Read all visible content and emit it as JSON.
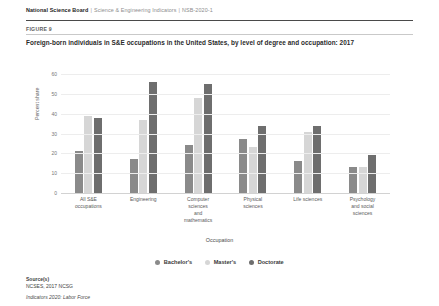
{
  "header": {
    "org": "National Science Board",
    "separator": "|",
    "publication": "Science & Engineering Indicators",
    "report_code": "NSB-2020-1"
  },
  "figure": {
    "label": "FIGURE 9",
    "title": "Foreign-born individuals in S&E occupations in the United States, by level of degree and occupation: 2017"
  },
  "source": {
    "label": "Source(s)",
    "line1": "NCSES, 2017 NCSG",
    "line2": "Indicators 2020: Labor Force"
  },
  "chart_data": {
    "type": "bar",
    "title": "Foreign-born individuals in S&E occupations in the United States, by level of degree and occupation: 2017",
    "xlabel": "Occupation",
    "ylabel": "Percent share",
    "ylim": [
      0,
      60
    ],
    "yticks": [
      "0",
      "10",
      "20",
      "30",
      "40",
      "50",
      "60"
    ],
    "grid": true,
    "legend_position": "bottom",
    "categories": [
      "All S&E occupations",
      "Engineering",
      "Computer sciences and mathematics",
      "Physical sciences",
      "Life sciences",
      "Psychology and social sciences"
    ],
    "category_lines": [
      [
        "All S&E",
        "occupations"
      ],
      [
        "Engineering"
      ],
      [
        "Computer",
        "sciences",
        "and",
        "mathematics"
      ],
      [
        "Physical",
        "sciences"
      ],
      [
        "Life sciences"
      ],
      [
        "Psychology",
        "and social",
        "sciences"
      ]
    ],
    "series": [
      {
        "name": "Bachelor's",
        "color": "#8a8a8a",
        "values": [
          21,
          17,
          24,
          27,
          16,
          13
        ]
      },
      {
        "name": "Master's",
        "color": "#d6d6d6",
        "values": [
          39,
          37,
          48,
          23,
          31,
          13
        ]
      },
      {
        "name": "Doctorate",
        "color": "#6e6e6e",
        "values": [
          38,
          56,
          55,
          34,
          34,
          19
        ]
      }
    ]
  }
}
